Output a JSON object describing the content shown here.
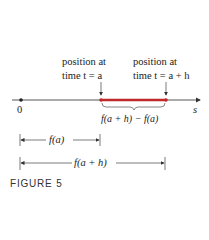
{
  "labels": {
    "left_line1": "position at",
    "left_line2": "time t = a",
    "right_line1": "position at",
    "right_line2": "time t = a + h",
    "origin": "0",
    "axis": "s",
    "difference": "f(a + h) − f(a)",
    "fa": "f(a)",
    "fah": "f(a + h)"
  },
  "caption": "FIGURE 5",
  "colors": {
    "segment": "#c0282a",
    "axis": "#333333"
  }
}
